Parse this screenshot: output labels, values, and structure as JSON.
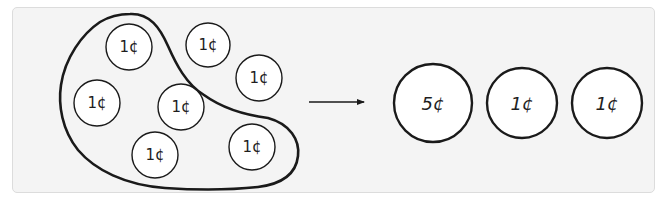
{
  "diagram": {
    "colors": {
      "panel_background": "#f4f4f4",
      "panel_border": "#dcdcdc",
      "stroke": "#1a1a1a",
      "coin_fill": "#ffffff"
    },
    "left_group": {
      "coins": [
        {
          "label": "1¢",
          "cx": 129,
          "cy": 47,
          "r": 23,
          "grouped": true
        },
        {
          "label": "1¢",
          "cx": 208,
          "cy": 45,
          "r": 22,
          "grouped": false
        },
        {
          "label": "1¢",
          "cx": 259,
          "cy": 78,
          "r": 23,
          "grouped": false
        },
        {
          "label": "1¢",
          "cx": 97,
          "cy": 103,
          "r": 23,
          "grouped": true
        },
        {
          "label": "1¢",
          "cx": 181,
          "cy": 107,
          "r": 23,
          "grouped": true
        },
        {
          "label": "1¢",
          "cx": 155,
          "cy": 155,
          "r": 23,
          "grouped": true
        },
        {
          "label": "1¢",
          "cx": 252,
          "cy": 147,
          "r": 23,
          "grouped": true
        }
      ],
      "enclosure_label": "group of five 1¢ coins"
    },
    "arrow": {
      "x1": 309,
      "y1": 102,
      "x2": 364,
      "y2": 102,
      "direction": "right"
    },
    "right_group": {
      "coins": [
        {
          "label": "5¢",
          "cx": 433,
          "cy": 103,
          "r": 39
        },
        {
          "label": "1¢",
          "cx": 522,
          "cy": 103,
          "r": 35
        },
        {
          "label": "1¢",
          "cx": 607,
          "cy": 103,
          "r": 35
        }
      ]
    }
  }
}
